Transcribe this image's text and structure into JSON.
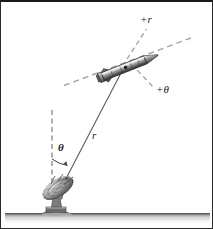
{
  "figure": {
    "background_color": "#ffffff",
    "border_color": "#2b2b2b",
    "ground_color": "#8a8a8a",
    "line_color": "#4a4a4a",
    "dash_color": "#9a9a9a",
    "label_color": "#1b1b1b"
  },
  "labels": {
    "plus_r": "+r",
    "plus_theta": "+θ",
    "radial_distance": "r",
    "angle": "θ"
  },
  "objects": {
    "rocket_name": "rocket",
    "dish_name": "satellite-dish",
    "ground_name": "ground-line"
  },
  "geometry": {
    "vertical_reference_line": {
      "x": 51,
      "y_top": 108,
      "y_bottom": 190
    },
    "radial_line": {
      "x1": 57,
      "y1": 192,
      "x2": 120,
      "y2": 70
    },
    "rocket_axis_dashed": {
      "x1": 63,
      "y1": 83,
      "x2": 190,
      "y2": 36
    },
    "plus_r_ray": {
      "x1": 126,
      "y1": 56,
      "x2": 146,
      "y2": 26
    },
    "plus_theta_ray": {
      "x1": 131,
      "y1": 62,
      "x2": 154,
      "y2": 87
    },
    "angle_arc_degrees": 27,
    "ground_y": 213
  }
}
